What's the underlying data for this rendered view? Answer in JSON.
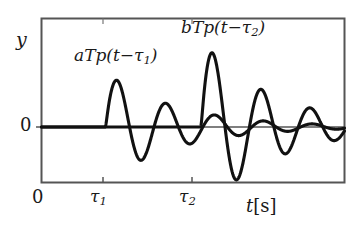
{
  "figure": {
    "background_color": "#ffffff",
    "frame_color": "#555555",
    "curve_color": "#111111",
    "text_color": "#1a1a1a"
  },
  "chart_data": {
    "type": "line",
    "title": "",
    "subtitle": "",
    "xlabel": "t[s]",
    "ylabel": "y",
    "grid": false,
    "legend": "none",
    "xlim": [
      0,
      10
    ],
    "ylim": [
      -1.0,
      1.35
    ],
    "xticks": [
      0,
      2.1,
      5.25
    ],
    "xticklabels": [
      "0",
      "τ1",
      "τ2"
    ],
    "yticks": [
      0
    ],
    "yticklabels": [
      "0"
    ],
    "annotations": [
      {
        "text": "aTp(t−τ1)",
        "target": "first-wavelet",
        "x": 2.4,
        "y": 1.0
      },
      {
        "text": "bTp(t−τ2)",
        "target": "second-wavelet",
        "x": 6.2,
        "y": 1.28
      }
    ],
    "series": [
      {
        "name": "aTp(t-tau1)",
        "description": "Damped ricker-like oscillation starting at tau1 = 2.1 s, peak amplitude 0.58, decaying envelope",
        "onset": 2.1,
        "amplitude": 0.58,
        "damping": 0.42,
        "frequency": 0.62
      },
      {
        "name": "bTp(t-tau2)",
        "description": "Damped ricker-like oscillation starting at tau2 = 5.25 s, peak amplitude 0.92, decaying envelope",
        "onset": 5.25,
        "amplitude": 0.92,
        "damping": 0.42,
        "frequency": 0.62
      }
    ]
  },
  "labels": {
    "y_axis": "y",
    "y_zero": "0",
    "x_origin": "0",
    "tau1_base": "τ",
    "tau1_sub": "1",
    "tau2_base": "τ",
    "tau2_sub": "2",
    "x_axis_var": "t",
    "x_axis_unit": "[s]",
    "wavelet_a_prefix": "aTp(t−τ",
    "wavelet_a_sub": "1",
    "wavelet_a_suffix": ")",
    "wavelet_b_prefix": "bTp(t−τ",
    "wavelet_b_sub": "2",
    "wavelet_b_suffix": ")"
  }
}
